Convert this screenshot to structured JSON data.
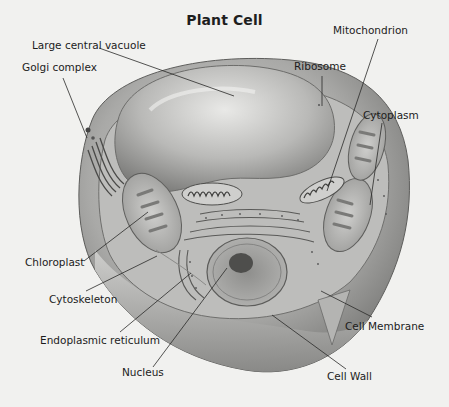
{
  "figure": {
    "title": "Plant Cell",
    "background_color": "#f1f1ef",
    "label_color": "#1c1c1c",
    "labels": {
      "mitochondrion": "Mitochondrion",
      "large_central_vacuole": "Large central vacuole",
      "ribosome": "Ribosome",
      "golgi_complex": "Golgi complex",
      "cytoplasm": "Cytoplasm",
      "chloroplast": "Chloroplast",
      "cytoskeleton": "Cytoskeleton",
      "endoplasmic_reticulum": "Endoplasmic reticulum",
      "nucleus": "Nucleus",
      "cell_membrane": "Cell Membrane",
      "cell_wall": "Cell Wall"
    }
  }
}
